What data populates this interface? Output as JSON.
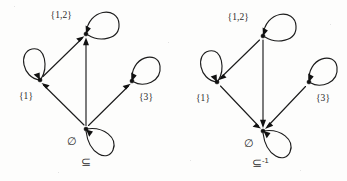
{
  "figure": {
    "background_color": "#fdfdfc",
    "ink_color": "#1c1c1c",
    "diagrams": [
      {
        "id": "subset-relation",
        "caption": "⊆",
        "caption_superscript": "",
        "caption_x": 86,
        "caption_y": 166,
        "direction": "edges point from smaller set up to larger set",
        "nodes": [
          {
            "id": "node-12",
            "label": "{1,2}",
            "x": 86,
            "y": 34,
            "label_x": 72,
            "label_y": 18,
            "label_anchor": "end",
            "loop_direction": "upper-right",
            "loop_arrow": true
          },
          {
            "id": "node-1",
            "label": "{1}",
            "x": 40,
            "y": 80,
            "label_x": 26,
            "label_y": 99,
            "label_anchor": "middle",
            "loop_direction": "upper-left",
            "loop_arrow": true
          },
          {
            "id": "node-3",
            "label": "{3}",
            "x": 132,
            "y": 81,
            "label_x": 146,
            "label_y": 100,
            "label_anchor": "middle",
            "loop_direction": "upper-right",
            "loop_arrow": true
          },
          {
            "id": "node-empty",
            "label": "∅",
            "x": 86,
            "y": 129,
            "label_x": 72,
            "label_y": 145,
            "label_anchor": "middle",
            "loop_direction": "lower-right",
            "loop_arrow": true
          }
        ],
        "edges": [
          {
            "id": "edge-empty-to-1",
            "from": "node-empty",
            "to": "node-1"
          },
          {
            "id": "edge-empty-to-12",
            "from": "node-empty",
            "to": "node-12"
          },
          {
            "id": "edge-empty-to-3",
            "from": "node-empty",
            "to": "node-3"
          },
          {
            "id": "edge-1-to-12",
            "from": "node-1",
            "to": "node-12"
          }
        ]
      },
      {
        "id": "inverse-subset-relation",
        "caption": "⊆",
        "caption_superscript": "-1",
        "caption_x": 260,
        "caption_y": 167,
        "direction": "edges point from larger set down to smaller set",
        "nodes": [
          {
            "id": "node-12",
            "label": "{1,2}",
            "x": 263,
            "y": 36,
            "label_x": 249,
            "label_y": 20,
            "label_anchor": "end",
            "loop_direction": "upper-right",
            "loop_arrow": true
          },
          {
            "id": "node-1",
            "label": "{1}",
            "x": 217,
            "y": 82,
            "label_x": 203,
            "label_y": 101,
            "label_anchor": "middle",
            "loop_direction": "upper-left",
            "loop_arrow": true
          },
          {
            "id": "node-3",
            "label": "{3}",
            "x": 309,
            "y": 82,
            "label_x": 323,
            "label_y": 101,
            "label_anchor": "middle",
            "loop_direction": "upper-right",
            "loop_arrow": true
          },
          {
            "id": "node-empty",
            "label": "∅",
            "x": 263,
            "y": 131,
            "label_x": 249,
            "label_y": 147,
            "label_anchor": "middle",
            "loop_direction": "lower-right",
            "loop_arrow": true
          }
        ],
        "edges": [
          {
            "id": "edge-1-to-empty",
            "from": "node-1",
            "to": "node-empty"
          },
          {
            "id": "edge-12-to-empty",
            "from": "node-12",
            "to": "node-empty"
          },
          {
            "id": "edge-3-to-empty",
            "from": "node-3",
            "to": "node-empty"
          },
          {
            "id": "edge-12-to-1",
            "from": "node-12",
            "to": "node-1"
          }
        ]
      }
    ]
  }
}
